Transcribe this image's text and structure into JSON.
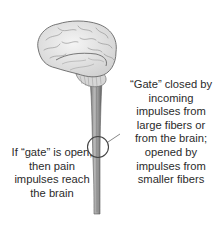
{
  "diagram": {
    "parts": [
      "brain",
      "cerebellum",
      "spinal-cord",
      "gate-circle",
      "leader-line"
    ],
    "colors": {
      "background": "#ffffff",
      "brain_fill": "#e6e6e6",
      "brain_stroke": "#6e6e6e",
      "spinal_cord": "#8a8a8a",
      "gate_circle": "#444444",
      "text": "#2b2b2b"
    }
  },
  "labels": {
    "right": {
      "lines": [
        "“Gate” closed by",
        "incoming",
        "impulses from",
        "large fibers or",
        "from the brain;",
        "opened by",
        "impulses from",
        "smaller fibers"
      ]
    },
    "left": {
      "lines": [
        "If “gate” is open,",
        "then pain",
        "impulses reach",
        "the brain"
      ]
    }
  }
}
